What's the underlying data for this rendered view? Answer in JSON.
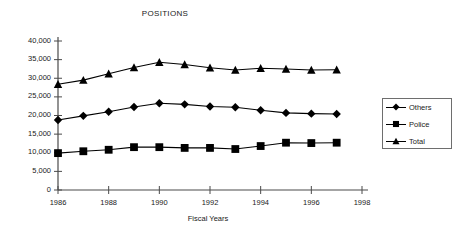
{
  "chart_data": {
    "type": "line",
    "title": "POSITIONS",
    "xlabel": "Fiscal Years",
    "ylabel": "",
    "x": [
      1986,
      1987,
      1988,
      1989,
      1990,
      1991,
      1992,
      1993,
      1994,
      1995,
      1996,
      1997
    ],
    "xlim": [
      1986,
      1998
    ],
    "ylim": [
      0,
      40000
    ],
    "xticks": [
      1986,
      1988,
      1990,
      1992,
      1994,
      1996,
      1998
    ],
    "xtick_labels": [
      "1986",
      "1988",
      "1990",
      "1992",
      "1994",
      "1996",
      "1998"
    ],
    "yticks": [
      0,
      5000,
      10000,
      15000,
      20000,
      25000,
      30000,
      35000,
      40000
    ],
    "ytick_labels": [
      "0",
      "5,000",
      "10,000",
      "15,000",
      "20,000",
      "25,000",
      "30,000",
      "35,000",
      "40,000"
    ],
    "grid": false,
    "legend_position": "right",
    "series": [
      {
        "name": "Others",
        "marker": "diamond",
        "color": "#000000",
        "values": [
          18800,
          19900,
          21000,
          22300,
          23300,
          23000,
          22400,
          22200,
          21400,
          20700,
          20500,
          20400
        ]
      },
      {
        "name": "Police",
        "marker": "square",
        "color": "#000000",
        "values": [
          9900,
          10400,
          10800,
          11500,
          11500,
          11300,
          11300,
          11000,
          11800,
          12700,
          12600,
          12700
        ]
      },
      {
        "name": "Total",
        "marker": "triangle",
        "color": "#000000",
        "values": [
          28400,
          29500,
          31200,
          32900,
          34300,
          33700,
          32800,
          32200,
          32700,
          32500,
          32200,
          32300
        ]
      }
    ]
  },
  "axis": {
    "line_color": "#4a4a4a"
  }
}
